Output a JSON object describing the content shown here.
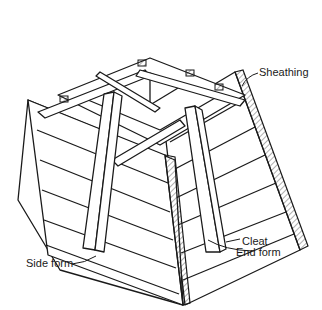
{
  "figure": {
    "labels": {
      "sheathing": "Sheathing",
      "cleat": "Cleat",
      "side_form": "Side form",
      "end_form": "End form"
    },
    "colors": {
      "ink": "#1a1a1a",
      "background": "#ffffff"
    }
  }
}
